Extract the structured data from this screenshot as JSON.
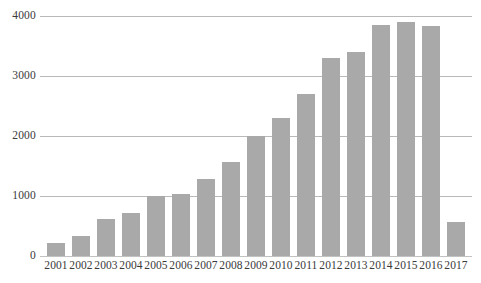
{
  "chart_data": {
    "type": "bar",
    "title": "",
    "subtitle": "",
    "xlabel": "",
    "ylabel": "",
    "categories": [
      "2001",
      "2002",
      "2003",
      "2004",
      "2005",
      "2006",
      "2007",
      "2008",
      "2009",
      "2010",
      "2011",
      "2012",
      "2013",
      "2014",
      "2015",
      "2016",
      "2017"
    ],
    "values": [
      220,
      330,
      620,
      720,
      1000,
      1030,
      1280,
      1570,
      2000,
      2300,
      2700,
      3300,
      3400,
      3850,
      3900,
      3830,
      570
    ],
    "series": [
      {
        "name": "",
        "values": [
          220,
          330,
          620,
          720,
          1000,
          1030,
          1280,
          1570,
          2000,
          2300,
          2700,
          3300,
          3400,
          3850,
          3900,
          3830,
          570
        ]
      }
    ],
    "ylim": [
      0,
      4000
    ],
    "yticks": [
      0,
      1000,
      2000,
      3000,
      4000
    ],
    "ytick_labels": [
      "0",
      "1000",
      "2000",
      "3000",
      "4000"
    ],
    "grid": true,
    "grid_axis": "y",
    "legend": false,
    "legend_position": "none",
    "annotations": [],
    "colors": {
      "bar": "#a9a9a9",
      "grid": "#b9b9b9",
      "text": "#3a3a3a",
      "background": "#ffffff"
    }
  }
}
